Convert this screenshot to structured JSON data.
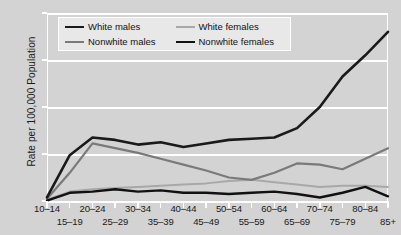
{
  "chart_data": {
    "type": "line",
    "title": "",
    "subtitle": "",
    "xlabel": "",
    "ylabel": "Rate per 100,000 Population",
    "xlim": [
      0,
      15
    ],
    "ylim": [
      0,
      80
    ],
    "yticks": [
      0,
      20,
      40,
      60,
      80
    ],
    "grid": true,
    "legend_position": "top-left-inside",
    "categories": [
      "10–14",
      "15–19",
      "20–24",
      "25–29",
      "30–34",
      "35–39",
      "40–44",
      "45–49",
      "50–54",
      "55–59",
      "60–64",
      "65–69",
      "70–74",
      "75–79",
      "80–84",
      "85+"
    ],
    "series": [
      {
        "name": "White males",
        "color": "#1a1a1a",
        "width": 2.6,
        "values": [
          1.5,
          19.5,
          27.0,
          26.0,
          24.0,
          25.0,
          23.0,
          24.5,
          26.0,
          26.5,
          27.0,
          31.0,
          40.0,
          53.0,
          62.0,
          72.0
        ]
      },
      {
        "name": "Nonwhite males",
        "color": "#7a7a7a",
        "width": 2.2,
        "values": [
          1.0,
          12.0,
          24.5,
          22.5,
          20.5,
          18.0,
          15.5,
          13.0,
          10.0,
          9.0,
          12.0,
          16.0,
          15.5,
          13.5,
          18.0,
          22.5
        ]
      },
      {
        "name": "White females",
        "color": "#a8a8a8",
        "width": 2.0,
        "values": [
          0.6,
          4.0,
          5.0,
          5.5,
          6.0,
          6.5,
          7.0,
          7.5,
          8.5,
          9.0,
          8.0,
          7.0,
          6.0,
          6.5,
          6.5,
          6.0
        ]
      },
      {
        "name": "Nonwhite females",
        "color": "#111111",
        "width": 2.4,
        "values": [
          0.2,
          3.5,
          4.0,
          5.0,
          4.0,
          4.5,
          3.5,
          3.5,
          3.0,
          3.5,
          4.0,
          3.0,
          1.5,
          3.5,
          6.0,
          2.0
        ]
      }
    ]
  },
  "axes": {
    "y_title": "Rate per 100,000 Population",
    "y_tick_labels": [
      "0",
      "20",
      "40",
      "60",
      "80"
    ],
    "x_tick_labels": [
      "10–14",
      "15–19",
      "20–24",
      "25–29",
      "30–34",
      "35–39",
      "40–44",
      "45–49",
      "50–54",
      "55–59",
      "60–64",
      "65–69",
      "70–74",
      "75–79",
      "80–84",
      "85+"
    ]
  },
  "legend": {
    "entries": [
      {
        "label": "White males",
        "color": "#1a1a1a",
        "width": 2.6
      },
      {
        "label": "White females",
        "color": "#a8a8a8",
        "width": 2.0
      },
      {
        "label": "Nonwhite males",
        "color": "#7a7a7a",
        "width": 2.2
      },
      {
        "label": "Nonwhite females",
        "color": "#111111",
        "width": 2.4
      }
    ]
  },
  "style": {
    "background": "#d3d3d3",
    "gridline_color": "#ffffff",
    "text_color": "#1a1a1a",
    "legend_background": "#e8e8e8"
  }
}
